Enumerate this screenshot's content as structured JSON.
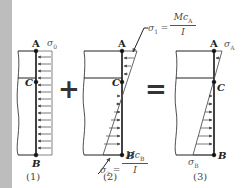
{
  "panels": [
    {
      "id": "1",
      "caption": "(1)",
      "points": {
        "top": "A",
        "middle": "C",
        "bottom": "B"
      },
      "stress_label": "σ",
      "stress_sub": "0",
      "distribution": "uniform"
    },
    {
      "id": "2",
      "caption": "(2)",
      "points": {
        "top": "A",
        "middle": "C",
        "bottom": "B"
      },
      "top_stress": {
        "lhs": "σ",
        "sub": "1",
        "eq": "=",
        "num": "Mc",
        "num_sub": "A",
        "den": "I"
      },
      "bottom_stress": {
        "lhs": "σ",
        "sub": "2",
        "eq": "=",
        "num": "Mc",
        "num_sub": "B",
        "den": "I"
      },
      "distribution": "linear-bending"
    },
    {
      "id": "3",
      "caption": "(3)",
      "points": {
        "top": "A",
        "middle": "C",
        "bottom": "B"
      },
      "top_stress": {
        "lhs": "σ",
        "sub": "A"
      },
      "bottom_stress": {
        "lhs": "σ",
        "sub": "B"
      },
      "distribution": "combined"
    }
  ],
  "operators": {
    "plus": "+",
    "equals": "="
  },
  "colors": {
    "line": "#222222",
    "arrow": "#555555",
    "sidebar": "#bdbdbd"
  }
}
